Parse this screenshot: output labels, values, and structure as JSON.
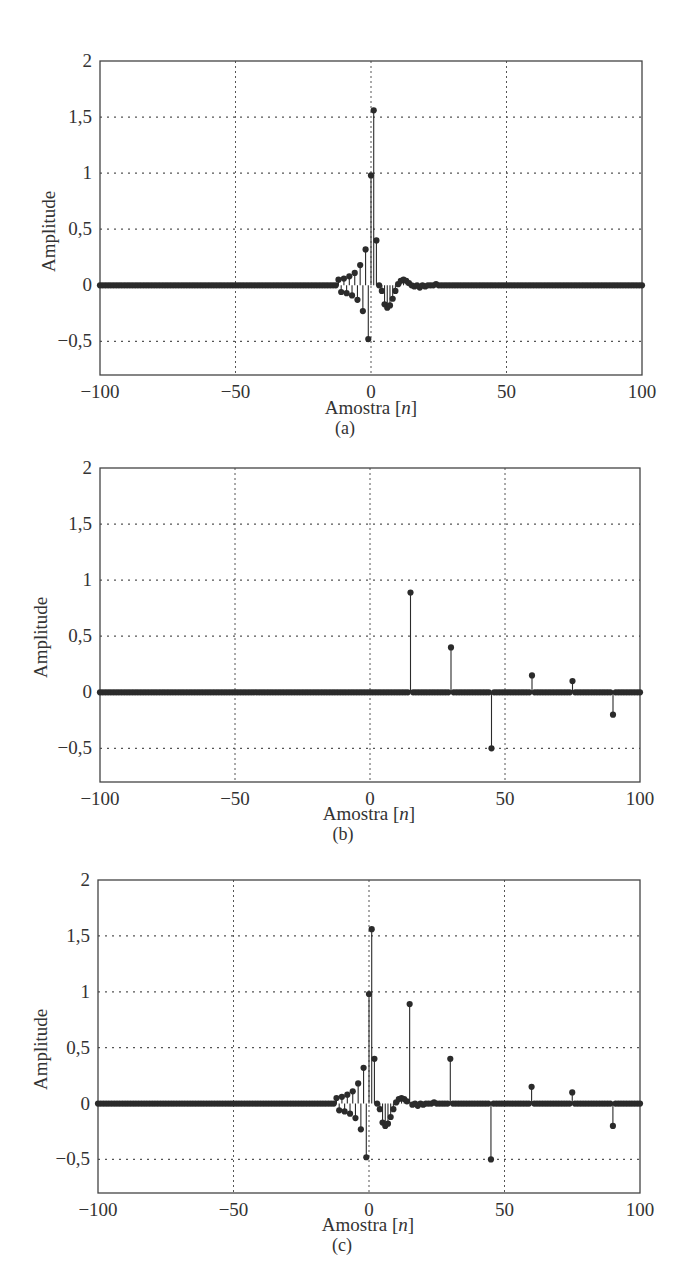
{
  "figures": [
    {
      "id": "a",
      "caption": "(a)",
      "title": "",
      "xlabel_prefix": "Amostra [",
      "xlabel_var": "n",
      "xlabel_suffix": "]",
      "ylabel": "Amplitude"
    },
    {
      "id": "b",
      "caption": "(b)",
      "title": "",
      "xlabel_prefix": "Amostra [",
      "xlabel_var": "n",
      "xlabel_suffix": "]",
      "ylabel": "Amplitude"
    },
    {
      "id": "c",
      "caption": "(c)",
      "title": "",
      "xlabel_prefix": "Amostra [",
      "xlabel_var": "n",
      "xlabel_suffix": "]",
      "ylabel": "Amplitude"
    }
  ],
  "axes": {
    "xticks": [
      "−100",
      "−50",
      "0",
      "50",
      "100"
    ],
    "xtick_values": [
      -100,
      -50,
      0,
      50,
      100
    ],
    "yticks": [
      "2",
      "1,5",
      "1",
      "0,5",
      "0",
      "−0,5"
    ],
    "ytick_values": [
      2,
      1.5,
      1,
      0.5,
      0,
      -0.5
    ]
  },
  "colors": {
    "stem": "#2b2b2b",
    "grid": "#555555",
    "frame": "#444444"
  },
  "chart_data": [
    {
      "type": "stem",
      "panel": "(a)",
      "title": "",
      "xlabel": "Amostra [n]",
      "ylabel": "Amplitude",
      "xlim": [
        -100,
        100
      ],
      "ylim": [
        -0.8,
        2
      ],
      "grid": true,
      "description": "Impulse response with alternating decaying tail before n=0 and ringing after n=0",
      "points": [
        {
          "n": -12,
          "y": 0.05
        },
        {
          "n": -11,
          "y": -0.06
        },
        {
          "n": -10,
          "y": 0.06
        },
        {
          "n": -9,
          "y": -0.07
        },
        {
          "n": -8,
          "y": 0.08
        },
        {
          "n": -7,
          "y": -0.09
        },
        {
          "n": -6,
          "y": 0.11
        },
        {
          "n": -5,
          "y": -0.13
        },
        {
          "n": -4,
          "y": 0.18
        },
        {
          "n": -3,
          "y": -0.23
        },
        {
          "n": -2,
          "y": 0.32
        },
        {
          "n": -1,
          "y": -0.48
        },
        {
          "n": 0,
          "y": 0.98
        },
        {
          "n": 1,
          "y": 1.56
        },
        {
          "n": 2,
          "y": 0.4
        },
        {
          "n": 3,
          "y": 0.0
        },
        {
          "n": 4,
          "y": -0.05
        },
        {
          "n": 5,
          "y": -0.17
        },
        {
          "n": 6,
          "y": -0.2
        },
        {
          "n": 7,
          "y": -0.18
        },
        {
          "n": 8,
          "y": -0.12
        },
        {
          "n": 9,
          "y": -0.05
        },
        {
          "n": 10,
          "y": 0.01
        },
        {
          "n": 11,
          "y": 0.04
        },
        {
          "n": 12,
          "y": 0.05
        },
        {
          "n": 13,
          "y": 0.04
        },
        {
          "n": 14,
          "y": 0.02
        },
        {
          "n": 16,
          "y": -0.01
        },
        {
          "n": 18,
          "y": -0.02
        },
        {
          "n": 20,
          "y": -0.01
        },
        {
          "n": 24,
          "y": 0.01
        }
      ]
    },
    {
      "type": "stem",
      "panel": "(b)",
      "title": "",
      "xlabel": "Amostra [n]",
      "ylabel": "Amplitude",
      "xlim": [
        -100,
        100
      ],
      "ylim": [
        -0.8,
        2
      ],
      "grid": true,
      "description": "Sparse impulses, zero elsewhere",
      "points": [
        {
          "n": 15,
          "y": 0.89
        },
        {
          "n": 30,
          "y": 0.4
        },
        {
          "n": 45,
          "y": -0.5
        },
        {
          "n": 60,
          "y": 0.15
        },
        {
          "n": 75,
          "y": 0.1
        },
        {
          "n": 90,
          "y": -0.2
        }
      ]
    },
    {
      "type": "stem",
      "panel": "(c)",
      "title": "",
      "xlabel": "Amostra [n]",
      "ylabel": "Amplitude",
      "xlim": [
        -100,
        100
      ],
      "ylim": [
        -0.8,
        2
      ],
      "grid": true,
      "description": "Sum of (a) and (b)",
      "points": [
        {
          "n": -12,
          "y": 0.05
        },
        {
          "n": -11,
          "y": -0.06
        },
        {
          "n": -10,
          "y": 0.06
        },
        {
          "n": -9,
          "y": -0.07
        },
        {
          "n": -8,
          "y": 0.08
        },
        {
          "n": -7,
          "y": -0.09
        },
        {
          "n": -6,
          "y": 0.11
        },
        {
          "n": -5,
          "y": -0.13
        },
        {
          "n": -4,
          "y": 0.18
        },
        {
          "n": -3,
          "y": -0.23
        },
        {
          "n": -2,
          "y": 0.32
        },
        {
          "n": -1,
          "y": -0.48
        },
        {
          "n": 0,
          "y": 0.98
        },
        {
          "n": 1,
          "y": 1.56
        },
        {
          "n": 2,
          "y": 0.4
        },
        {
          "n": 3,
          "y": 0.0
        },
        {
          "n": 4,
          "y": -0.05
        },
        {
          "n": 5,
          "y": -0.17
        },
        {
          "n": 6,
          "y": -0.2
        },
        {
          "n": 7,
          "y": -0.18
        },
        {
          "n": 8,
          "y": -0.12
        },
        {
          "n": 9,
          "y": -0.05
        },
        {
          "n": 10,
          "y": 0.01
        },
        {
          "n": 11,
          "y": 0.04
        },
        {
          "n": 12,
          "y": 0.05
        },
        {
          "n": 13,
          "y": 0.04
        },
        {
          "n": 14,
          "y": 0.02
        },
        {
          "n": 15,
          "y": 0.89
        },
        {
          "n": 16,
          "y": -0.01
        },
        {
          "n": 18,
          "y": -0.02
        },
        {
          "n": 20,
          "y": -0.01
        },
        {
          "n": 24,
          "y": 0.01
        },
        {
          "n": 30,
          "y": 0.4
        },
        {
          "n": 45,
          "y": -0.5
        },
        {
          "n": 60,
          "y": 0.15
        },
        {
          "n": 75,
          "y": 0.1
        },
        {
          "n": 90,
          "y": -0.2
        }
      ]
    }
  ]
}
